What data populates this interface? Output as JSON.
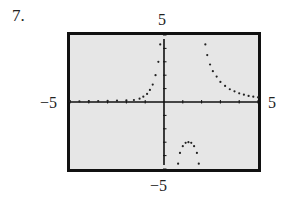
{
  "problem": {
    "number": "7."
  },
  "window_labels": {
    "xmin": "−5",
    "xmax": "5",
    "ymin": "−5",
    "ymax": "5"
  },
  "colors": {
    "frame": "#111111",
    "screen_bg": "#e6e6e6",
    "axis": "#111111",
    "dots": "#222222"
  },
  "chart_data": {
    "type": "scatter",
    "title": "",
    "xlabel": "",
    "ylabel": "",
    "xlim": [
      -5,
      5
    ],
    "ylim": [
      -5,
      5
    ],
    "xticks": [
      -5,
      -4,
      -3,
      -2,
      -1,
      0,
      1,
      2,
      3,
      4,
      5
    ],
    "yticks": [
      -5,
      -4,
      -3,
      -2,
      -1,
      0,
      1,
      2,
      3,
      4,
      5
    ],
    "grid": false,
    "legend": "none",
    "style": "graphing-calculator dot plot",
    "series": [
      {
        "name": "left branch",
        "points": [
          [
            -5,
            0.05
          ],
          [
            -4.5,
            0.05
          ],
          [
            -4,
            0.06
          ],
          [
            -3.5,
            0.07
          ],
          [
            -3,
            0.08
          ],
          [
            -2.5,
            0.1
          ],
          [
            -2,
            0.12
          ],
          [
            -1.6,
            0.15
          ],
          [
            -1.3,
            0.25
          ],
          [
            -1.1,
            0.4
          ],
          [
            -0.9,
            0.6
          ],
          [
            -0.75,
            0.9
          ],
          [
            -0.6,
            1.3
          ],
          [
            -0.45,
            2.0
          ],
          [
            -0.3,
            3.0
          ],
          [
            -0.2,
            4.3
          ]
        ]
      },
      {
        "name": "middle branch",
        "points": [
          [
            0.75,
            -4.6
          ],
          [
            0.85,
            -3.8
          ],
          [
            1.0,
            -3.3
          ],
          [
            1.15,
            -3.05
          ],
          [
            1.3,
            -3.0
          ],
          [
            1.45,
            -3.05
          ],
          [
            1.6,
            -3.3
          ],
          [
            1.75,
            -3.8
          ],
          [
            1.85,
            -4.6
          ]
        ]
      },
      {
        "name": "right branch",
        "points": [
          [
            2.2,
            4.3
          ],
          [
            2.3,
            3.5
          ],
          [
            2.45,
            2.8
          ],
          [
            2.6,
            2.3
          ],
          [
            2.8,
            1.9
          ],
          [
            3.0,
            1.5
          ],
          [
            3.25,
            1.2
          ],
          [
            3.5,
            0.95
          ],
          [
            3.75,
            0.8
          ],
          [
            4.0,
            0.65
          ],
          [
            4.25,
            0.55
          ],
          [
            4.5,
            0.45
          ],
          [
            4.75,
            0.4
          ],
          [
            5.0,
            0.35
          ]
        ]
      }
    ]
  }
}
